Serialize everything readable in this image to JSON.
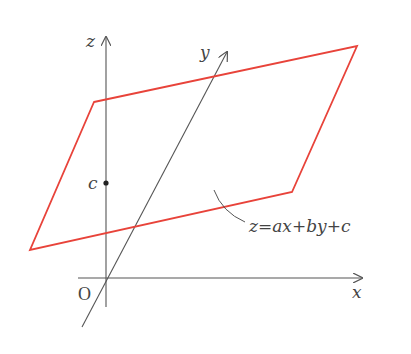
{
  "diagram": {
    "title": "",
    "axes": {
      "x": {
        "label": "x",
        "origin": [
          106,
          278
        ],
        "tip": [
          362,
          278
        ],
        "start": [
          78,
          278
        ]
      },
      "y": {
        "label": "y",
        "tip": [
          227,
          52
        ],
        "start": [
          82,
          327
        ]
      },
      "z": {
        "label": "z",
        "tip": [
          106,
          37
        ],
        "start": [
          106,
          307
        ]
      }
    },
    "origin_label": "O",
    "intercept_label": "c",
    "intercept_point": [
      105,
      183
    ],
    "plane": {
      "vertices": [
        [
          94,
          102
        ],
        [
          357,
          46
        ],
        [
          292,
          192
        ],
        [
          30,
          250
        ]
      ],
      "color": "#e8433a"
    },
    "equation_label": "z=ax+by+c",
    "axis_color": "#555555"
  }
}
